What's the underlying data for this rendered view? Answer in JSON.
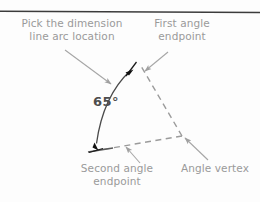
{
  "figure": {
    "type": "technical-drawing-annotation",
    "background_color": "#fdfdfd",
    "annotation_color": "#9a9a9a",
    "geometry_color": "#808080",
    "value_color": "#4d4d4d",
    "top_rule_color": "#3c3c3c"
  },
  "annotations": {
    "pick_arc": "Pick the dimension\nline arc location",
    "first_endpoint": "First angle\nendpoint",
    "second_endpoint": "Second angle\nendpoint",
    "angle_vertex": "Angle vertex"
  },
  "dimension": {
    "angle_label": "65°",
    "value": 65,
    "unit": "degrees"
  },
  "geometry": {
    "vertex": {
      "x": 182,
      "y": 136
    },
    "first_endpoint": {
      "x": 141,
      "y": 66
    },
    "second_endpoint": {
      "x": 92,
      "y": 151
    },
    "arc_start": {
      "x": 129,
      "y": 69
    },
    "arc_end": {
      "x": 96,
      "y": 143
    },
    "dashed_legs": 2,
    "arc_terminators": 2
  }
}
